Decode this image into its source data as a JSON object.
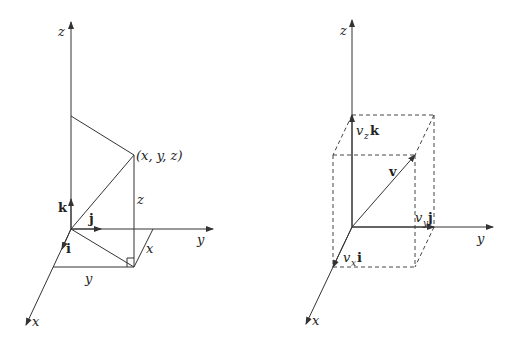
{
  "left_diagram": {
    "axes": {
      "x": "x",
      "y": "y",
      "z": "z"
    },
    "unit_vectors": {
      "i": "i",
      "j": "j",
      "k": "k"
    },
    "point_label": "(x, y, z)",
    "edge_labels": {
      "x": "x",
      "y": "y",
      "z": "z"
    }
  },
  "right_diagram": {
    "axes": {
      "x": "x",
      "y": "y",
      "z": "z"
    },
    "vector_label": "v",
    "components": {
      "vx": {
        "coef": "v",
        "sub": "x",
        "unit": "i"
      },
      "vy": {
        "coef": "v",
        "sub": "y",
        "unit": "j"
      },
      "vz": {
        "coef": "v",
        "sub": "z",
        "unit": "k"
      }
    }
  },
  "colors": {
    "line": "#333333",
    "background": "#ffffff"
  }
}
